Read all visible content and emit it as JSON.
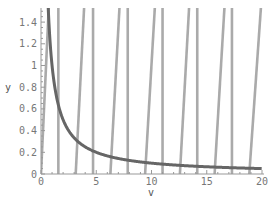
{
  "chart_data": {
    "type": "line",
    "title": "",
    "xlabel": "v",
    "ylabel": "y",
    "xlim": [
      0,
      20
    ],
    "ylim": [
      0,
      1.53
    ],
    "grid": false,
    "legend": null,
    "x_ticks": [
      0,
      5,
      10,
      15,
      20
    ],
    "x_tick_labels": [
      "0",
      "5",
      "10",
      "15",
      "20"
    ],
    "y_ticks": [
      0,
      0.2,
      0.4,
      0.6,
      0.8,
      1,
      1.2,
      1.4
    ],
    "y_tick_labels": [
      "0",
      "0.2",
      "0.4",
      "0.6",
      "0.8",
      "1",
      "1.2",
      "1.4"
    ],
    "series": [
      {
        "name": "decaying curve (~1/v)",
        "color": "#666666",
        "x": [
          0.6,
          0.8,
          1,
          1.5,
          2,
          3,
          4,
          5,
          6,
          8,
          10,
          12,
          14,
          16,
          18,
          20
        ],
        "values": [
          1.53,
          1.2,
          1.0,
          0.67,
          0.5,
          0.33,
          0.25,
          0.2,
          0.17,
          0.125,
          0.1,
          0.083,
          0.071,
          0.063,
          0.056,
          0.05
        ]
      },
      {
        "name": "vertical lines (near v = pi/2 + k*pi)",
        "color": "#aaaaaa",
        "x_positions": [
          1.57,
          4.71,
          7.85,
          11.0,
          14.14,
          17.28
        ]
      },
      {
        "name": "slanted lines (from v = k*pi, y=0 rising)",
        "color": "#aaaaaa",
        "segments": [
          {
            "x0": 0.0,
            "y0": 0,
            "x1": 0.7,
            "y1": 1.53
          },
          {
            "x0": 3.14,
            "y0": 0,
            "x1": 3.9,
            "y1": 1.53
          },
          {
            "x0": 6.28,
            "y0": 0,
            "x1": 7.1,
            "y1": 1.53
          },
          {
            "x0": 9.42,
            "y0": 0,
            "x1": 10.3,
            "y1": 1.53
          },
          {
            "x0": 12.57,
            "y0": 0,
            "x1": 13.4,
            "y1": 1.53
          },
          {
            "x0": 15.71,
            "y0": 0,
            "x1": 16.6,
            "y1": 1.53
          },
          {
            "x0": 18.85,
            "y0": 0,
            "x1": 19.9,
            "y1": 1.53
          }
        ]
      }
    ]
  },
  "axes": {
    "xlabel": "v",
    "ylabel": "y"
  }
}
